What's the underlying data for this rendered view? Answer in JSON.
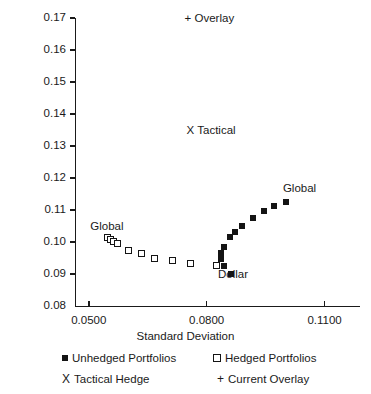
{
  "chart_data": {
    "type": "scatter",
    "title": "",
    "xlabel": "Standard Deviation",
    "ylabel": "Average Return (Percent per Annum)",
    "xlim": [
      0.0465,
      0.119
    ],
    "ylim": [
      0.08,
      0.17
    ],
    "xticks": [
      "0.0500",
      "0.0800",
      "0.1100"
    ],
    "xtick_values": [
      0.05,
      0.08,
      0.11
    ],
    "yticks": [
      "0.08",
      "0.09",
      "0.10",
      "0.11",
      "0.12",
      "0.13",
      "0.14",
      "0.15",
      "0.16",
      "0.17"
    ],
    "ytick_values": [
      0.08,
      0.09,
      0.1,
      0.11,
      0.12,
      0.13,
      0.14,
      0.15,
      0.16,
      0.17
    ],
    "grid": false,
    "legend_position": "below-axis",
    "series": [
      {
        "name": "Unhedged Portfolios",
        "marker": "filled-square",
        "color": "#141414",
        "points": [
          {
            "x": 0.0845,
            "y": 0.0925
          },
          {
            "x": 0.0837,
            "y": 0.0946
          },
          {
            "x": 0.0836,
            "y": 0.0967
          },
          {
            "x": 0.0844,
            "y": 0.0984
          },
          {
            "x": 0.086,
            "y": 0.1015
          },
          {
            "x": 0.0872,
            "y": 0.1032
          },
          {
            "x": 0.089,
            "y": 0.105
          },
          {
            "x": 0.0917,
            "y": 0.1074
          },
          {
            "x": 0.0945,
            "y": 0.1096
          },
          {
            "x": 0.0972,
            "y": 0.1113
          },
          {
            "x": 0.1002,
            "y": 0.1125
          },
          {
            "x": 0.0862,
            "y": 0.09
          }
        ]
      },
      {
        "name": "Hedged Portfolios",
        "marker": "open-square",
        "color": "#141414",
        "points": [
          {
            "x": 0.0547,
            "y": 0.1013
          },
          {
            "x": 0.0556,
            "y": 0.1008
          },
          {
            "x": 0.0564,
            "y": 0.1002
          },
          {
            "x": 0.0574,
            "y": 0.0995
          },
          {
            "x": 0.0601,
            "y": 0.0973
          },
          {
            "x": 0.0634,
            "y": 0.0963
          },
          {
            "x": 0.0668,
            "y": 0.095
          },
          {
            "x": 0.0712,
            "y": 0.0941
          },
          {
            "x": 0.076,
            "y": 0.0934
          },
          {
            "x": 0.0824,
            "y": 0.0927
          }
        ]
      },
      {
        "name": "Tactical Hedge",
        "marker": "x",
        "color": "#141414",
        "points": []
      },
      {
        "name": "Current Overlay",
        "marker": "plus",
        "color": "#141414",
        "points": []
      }
    ],
    "annotations": [
      {
        "text": "+ Overlay",
        "x": 0.081,
        "y": 0.17,
        "name": "overlay-annotation"
      },
      {
        "text": "X Tactical",
        "x": 0.0815,
        "y": 0.135,
        "name": "tactical-annotation"
      },
      {
        "text": "Global",
        "x": 0.106,
        "y": 0.117,
        "name": "global-right-annotation"
      },
      {
        "text": "Global",
        "x": 0.057,
        "y": 0.105,
        "name": "global-left-annotation"
      },
      {
        "text": "Dollar",
        "x": 0.0895,
        "y": 0.09,
        "name": "dollar-annotation"
      }
    ]
  },
  "legend": {
    "items": [
      {
        "label": "Unhedged Portfolios",
        "marker": "filled-square"
      },
      {
        "label": "Hedged Portfolios",
        "marker": "open-square"
      },
      {
        "label": "Tactical Hedge",
        "marker": "x"
      },
      {
        "label": "Current Overlay",
        "marker": "plus"
      }
    ]
  }
}
